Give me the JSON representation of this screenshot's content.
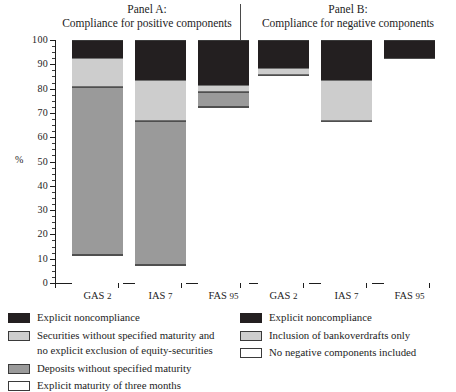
{
  "chart_data": {
    "type": "bar",
    "title": "",
    "subtitle": "",
    "xlabel": "",
    "ylabel": "%",
    "ylim": [
      0,
      100
    ],
    "ytick_labels": [
      "0",
      "10",
      "20",
      "30",
      "40",
      "50",
      "60",
      "70",
      "80",
      "90",
      "100"
    ],
    "ytick_values": [
      0,
      10,
      20,
      30,
      40,
      50,
      60,
      70,
      80,
      90,
      100
    ],
    "ytick_minor_step": 2.5,
    "grid": false,
    "stacked": true,
    "legend_position": "bottom",
    "panels": [
      {
        "key": "panel_a",
        "title_line1": "Panel A:",
        "title_line2": "Compliance for positive components",
        "categories": [
          "GAS 2",
          "IAS 7",
          "FAS 95"
        ],
        "series": [
          {
            "name": "Explicit maturity of three months",
            "color": "#ffffff",
            "values": [
              12,
              8,
              73
            ]
          },
          {
            "name": "Deposits without specified maturity",
            "color": "#9a9a9a",
            "values": [
              69,
              59,
              6
            ]
          },
          {
            "name": "Securities without specified maturity and no explicit exclusion of equity-securities",
            "color": "#cdcdcd",
            "values": [
              12,
              17,
              3
            ]
          },
          {
            "name": "Explicit noncompliance",
            "color": "#231f20",
            "values": [
              7,
              16,
              18
            ]
          }
        ],
        "boundaries": [
          {
            "category": "GAS 2",
            "white_top": 12,
            "dkgray_top": 81,
            "ltgray_top": 93,
            "black_top": 100
          },
          {
            "category": "IAS 7",
            "white_top": 8,
            "dkgray_top": 67,
            "ltgray_top": 84,
            "black_top": 100
          },
          {
            "category": "FAS 95",
            "white_top": 73,
            "dkgray_top": 79,
            "ltgray_top": 82,
            "black_top": 100
          }
        ]
      },
      {
        "key": "panel_b",
        "title_line1": "Panel B:",
        "title_line2": "Compliance for negative components",
        "categories": [
          "GAS 2",
          "IAS 7",
          "FAS 95"
        ],
        "series": [
          {
            "name": "No negative components included",
            "color": "#ffffff",
            "values": [
              86,
              67,
              93
            ]
          },
          {
            "name": "Inclusion of bankoverdrafts only",
            "color": "#cdcdcd",
            "values": [
              3,
              17,
              0
            ]
          },
          {
            "name": "Explicit noncompliance",
            "color": "#231f20",
            "values": [
              11,
              16,
              7
            ]
          }
        ],
        "boundaries": [
          {
            "category": "GAS 2",
            "white_top": 86,
            "ltgray_top": 89,
            "black_top": 100
          },
          {
            "category": "IAS 7",
            "white_top": 67,
            "ltgray_top": 84,
            "black_top": 100
          },
          {
            "category": "FAS 95",
            "white_top": 93,
            "ltgray_top": 93,
            "black_top": 100
          }
        ]
      }
    ],
    "legends": [
      {
        "key": "legend_left",
        "items": [
          {
            "swatch": "black",
            "line1": "Explicit noncompliance",
            "line2": ""
          },
          {
            "swatch": "ltgray",
            "line1": "Securities without specified maturity and",
            "line2": "no explicit exclusion of equity-securities"
          },
          {
            "swatch": "dkgray",
            "line1": "Deposits without specified maturity",
            "line2": ""
          },
          {
            "swatch": "white",
            "line1": "Explicit maturity of three months",
            "line2": ""
          }
        ]
      },
      {
        "key": "legend_right",
        "items": [
          {
            "swatch": "black",
            "line1": "Explicit noncompliance",
            "line2": ""
          },
          {
            "swatch": "ltgray",
            "line1": "Inclusion of bankoverdrafts only",
            "line2": ""
          },
          {
            "swatch": "white",
            "line1": "No negative components included",
            "line2": ""
          }
        ]
      }
    ],
    "colors": {
      "black": "#231f20",
      "light_gray": "#cdcdcd",
      "dark_gray": "#9a9a9a",
      "white": "#ffffff",
      "axis": "#1d1d1d"
    }
  }
}
